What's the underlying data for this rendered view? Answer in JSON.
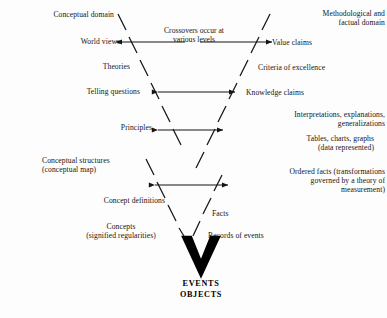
{
  "figure": {
    "type": "gowin-v-epistemological-diagram",
    "background_color": "#fdfdfd",
    "ink_color": "#141414"
  },
  "center": {
    "crossover_note": "Crossovers occur at\nvarious levels",
    "apex_label": "EVENTS\nOBJECTS"
  },
  "left_side": {
    "heading": "Conceptual domain",
    "items": [
      "Conceptual domain",
      "World views",
      "Theories",
      "Telling questions",
      "Principles",
      "Conceptual structures\n(conceptual map)",
      "Concept definitions",
      "Concepts\n(signified regularities)"
    ]
  },
  "right_side": {
    "heading": "Methodological and\nfactual domain",
    "items": [
      "Methodological and\nfactual domain",
      "Value claims",
      "Criteria of excellence",
      "Knowledge claims",
      "Interpretations, explanations,\ngeneralizations",
      "Tables, charts, graphs\n(data represented)",
      "Ordered facts (transformations\ngoverned by a theory of\nmeasurement)",
      "Facts",
      "Records of events"
    ]
  },
  "arrows": [
    {
      "name": "crossover-arrow-top-left",
      "direction": "left",
      "level": "world-views"
    },
    {
      "name": "crossover-arrow-top-right",
      "direction": "right",
      "level": "value-claims"
    },
    {
      "name": "crossover-arrow-theories",
      "direction": "both",
      "level": "knowledge-claims"
    },
    {
      "name": "crossover-arrow-principles",
      "direction": "both",
      "level": "tables-charts-graphs"
    },
    {
      "name": "crossover-arrow-structures",
      "direction": "both",
      "level": "ordered-facts"
    }
  ]
}
